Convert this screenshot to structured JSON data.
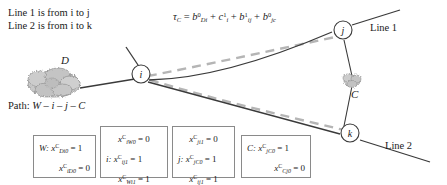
{
  "legend": {
    "line1": "Line 1 is from i to j",
    "line2": "Line 2 is from i to k"
  },
  "formula": {
    "lhs": "τ",
    "lhs_sub": "C",
    "eq": "=",
    "terms": [
      {
        "base": "b",
        "sub": "Di",
        "sup": "0"
      },
      {
        "base": "c",
        "sub": "i",
        "sup": "1"
      },
      {
        "base": "b",
        "sub": "ij",
        "sup": "1"
      },
      {
        "base": "b",
        "sub": "jc",
        "sup": "0"
      }
    ],
    "plus": "+"
  },
  "nodes": {
    "i": "i",
    "j": "j",
    "k": "k"
  },
  "clouds": {
    "d": "D",
    "c": "C"
  },
  "line_labels": {
    "line1": "Line 1",
    "line2": "Line 2"
  },
  "path": {
    "label": "Path:",
    "value": "W – i – j – C"
  },
  "boxes": [
    {
      "id": "box-w",
      "prefix": "W:",
      "rows": [
        {
          "prefix": "W:",
          "var": "x",
          "sub": "Di0",
          "sup": "C",
          "eq": "=",
          "value": "1",
          "align": "left"
        },
        {
          "prefix": "",
          "var": "x",
          "sub": "iD0",
          "sup": "C",
          "eq": "=",
          "value": "0",
          "align": "right"
        }
      ]
    },
    {
      "id": "box-i",
      "prefix": "i:",
      "rows": [
        {
          "prefix": "",
          "var": "x",
          "sub": "iW0",
          "sup": "C",
          "eq": "=",
          "value": "0",
          "align": "center"
        },
        {
          "prefix": "i:",
          "var": "x",
          "sub": "ij1",
          "sup": "C",
          "eq": "=",
          "value": "1",
          "align": "left"
        },
        {
          "prefix": "",
          "var": "x",
          "sub": "Wi1",
          "sup": "C",
          "eq": "=",
          "value": "1",
          "align": "center"
        }
      ]
    },
    {
      "id": "box-j",
      "prefix": "j:",
      "rows": [
        {
          "prefix": "",
          "var": "x",
          "sub": "ji1",
          "sup": "C",
          "eq": "=",
          "value": "0",
          "align": "center"
        },
        {
          "prefix": "j:",
          "var": "x",
          "sub": "jC0",
          "sup": "C",
          "eq": "=",
          "value": "1",
          "align": "left"
        },
        {
          "prefix": "",
          "var": "x",
          "sub": "ij1",
          "sup": "C",
          "eq": "=",
          "value": "1",
          "align": "center"
        }
      ]
    },
    {
      "id": "box-c",
      "prefix": "C:",
      "rows": [
        {
          "prefix": "C:",
          "var": "x",
          "sub": "jC0",
          "sup": "C",
          "eq": "=",
          "value": "1",
          "align": "left"
        },
        {
          "prefix": "",
          "var": "x",
          "sub": "Cj0",
          "sup": "C",
          "eq": "=",
          "value": "0",
          "align": "right"
        }
      ]
    }
  ],
  "colors": {
    "solid_line": "#3a3a3a",
    "dashed_line": "#b0b0b0",
    "cloud": "#9a9a9a",
    "box_border": "#8a8a8a",
    "text": "#1a1a1a"
  }
}
